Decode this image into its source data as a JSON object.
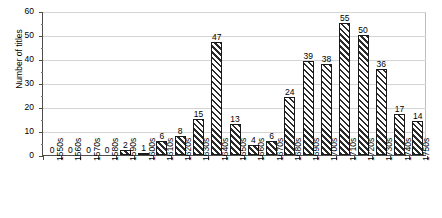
{
  "chart_data": {
    "type": "bar",
    "title": "",
    "xlabel": "",
    "ylabel": "Number of titles",
    "ylim": [
      0,
      60
    ],
    "yticks": [
      0,
      10,
      20,
      30,
      40,
      50,
      60
    ],
    "grid": true,
    "legend": "none",
    "show_value_labels": true,
    "categories": [
      "1550s",
      "1560s",
      "1570s",
      "1580s",
      "1590s",
      "1600s",
      "1610s",
      "1620s",
      "1630s",
      "1640s",
      "1650s",
      "1660s",
      "1670s",
      "1680s",
      "1690s",
      "1700s",
      "1710s",
      "1720s",
      "1730s",
      "1740s",
      "1750s"
    ],
    "values": [
      0,
      0,
      0,
      0,
      2,
      1,
      6,
      8,
      15,
      47,
      13,
      4,
      6,
      24,
      39,
      38,
      55,
      50,
      36,
      17,
      14
    ],
    "series": [
      {
        "name": "Number of titles",
        "values": [
          0,
          0,
          0,
          0,
          2,
          1,
          6,
          8,
          15,
          47,
          13,
          4,
          6,
          24,
          39,
          38,
          55,
          50,
          36,
          17,
          14
        ]
      }
    ],
    "bar_fill": "diagonal-hatch",
    "bar_edge_color": "#1a1a1a",
    "gridline_color": "#d4d4d4",
    "axis_color": "#4d4d4d"
  }
}
